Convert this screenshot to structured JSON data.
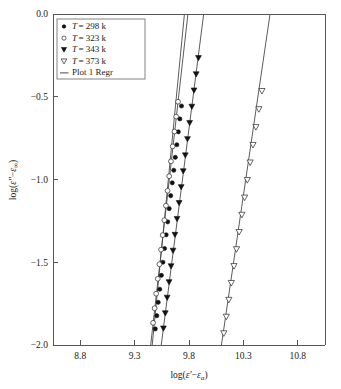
{
  "chart_data": {
    "type": "scatter",
    "title": "",
    "xlabel": "log(ε′−εₐ)",
    "ylabel": "log(ε″−ε∞)",
    "xlim": [
      8.55,
      11.05
    ],
    "ylim": [
      -2.0,
      0.0
    ],
    "xticks": [
      "8.8",
      "9.3",
      "9.8",
      "10.3",
      "10.8"
    ],
    "xtick_values": [
      8.8,
      9.3,
      9.8,
      10.3,
      10.8
    ],
    "yticks": [
      "0.0",
      "-0.5",
      "-1.0",
      "-1.5",
      "-2.0"
    ],
    "ytick_values": [
      0.0,
      -0.5,
      -1.0,
      -1.5,
      -2.0
    ],
    "grid": false,
    "legend_position": "top-left",
    "series": [
      {
        "name": "T = 298 k",
        "marker": "filled-circle",
        "points": [
          [
            9.49,
            -1.903
          ],
          [
            9.504,
            -1.823
          ],
          [
            9.517,
            -1.742
          ],
          [
            9.531,
            -1.663
          ],
          [
            9.546,
            -1.579
          ],
          [
            9.56,
            -1.5
          ],
          [
            9.575,
            -1.417
          ],
          [
            9.59,
            -1.334
          ],
          [
            9.604,
            -1.256
          ],
          [
            9.618,
            -1.176
          ],
          [
            9.632,
            -1.098
          ],
          [
            9.646,
            -1.02
          ],
          [
            9.66,
            -0.944
          ],
          [
            9.674,
            -0.866
          ],
          [
            9.688,
            -0.79
          ],
          [
            9.702,
            -0.712
          ],
          [
            9.716,
            -0.634
          ],
          [
            9.731,
            -0.556
          ]
        ]
      },
      {
        "name": "T = 323 k",
        "marker": "open-circle",
        "points": [
          [
            9.47,
            -1.866
          ],
          [
            9.484,
            -1.778
          ],
          [
            9.498,
            -1.69
          ],
          [
            9.513,
            -1.6
          ],
          [
            9.528,
            -1.512
          ],
          [
            9.543,
            -1.424
          ],
          [
            9.558,
            -1.336
          ],
          [
            9.573,
            -1.246
          ],
          [
            9.588,
            -1.158
          ],
          [
            9.603,
            -1.068
          ],
          [
            9.618,
            -0.98
          ],
          [
            9.634,
            -0.89
          ],
          [
            9.65,
            -0.8
          ],
          [
            9.666,
            -0.71
          ],
          [
            9.682,
            -0.62
          ],
          [
            9.699,
            -0.53
          ]
        ]
      },
      {
        "name": "T = 343 k",
        "marker": "filled-triangle-down",
        "points": [
          [
            9.565,
            -1.9
          ],
          [
            9.582,
            -1.808
          ],
          [
            9.599,
            -1.714
          ],
          [
            9.617,
            -1.62
          ],
          [
            9.635,
            -1.524
          ],
          [
            9.653,
            -1.43
          ],
          [
            9.671,
            -1.334
          ],
          [
            9.69,
            -1.238
          ],
          [
            9.709,
            -1.142
          ],
          [
            9.728,
            -1.046
          ],
          [
            9.747,
            -0.95
          ],
          [
            9.766,
            -0.854
          ],
          [
            9.786,
            -0.756
          ],
          [
            9.806,
            -0.658
          ],
          [
            9.826,
            -0.56
          ],
          [
            9.846,
            -0.462
          ],
          [
            9.866,
            -0.364
          ],
          [
            9.887,
            -0.266
          ]
        ]
      },
      {
        "name": "T = 373 k",
        "marker": "open-triangle-down",
        "points": [
          [
            10.12,
            -1.93
          ],
          [
            10.143,
            -1.83
          ],
          [
            10.166,
            -1.728
          ],
          [
            10.189,
            -1.626
          ],
          [
            10.213,
            -1.524
          ],
          [
            10.237,
            -1.422
          ],
          [
            10.261,
            -1.318
          ],
          [
            10.286,
            -1.214
          ],
          [
            10.311,
            -1.11
          ],
          [
            10.336,
            -1.004
          ],
          [
            10.362,
            -0.898
          ],
          [
            10.388,
            -0.792
          ],
          [
            10.415,
            -0.684
          ],
          [
            10.442,
            -0.576
          ],
          [
            10.47,
            -0.466
          ]
        ]
      }
    ],
    "regression_lines": [
      {
        "name": "Plot 1 Regr (298 k)",
        "x0": 9.462,
        "y0": -2.0,
        "x1": 9.758,
        "y1": 0.0
      },
      {
        "name": "Plot 1 Regr (323 k)",
        "x0": 9.448,
        "y0": -2.0,
        "x1": 9.79,
        "y1": 0.0
      },
      {
        "name": "Plot 1 Regr (343 k)",
        "x0": 9.545,
        "y0": -2.0,
        "x1": 9.935,
        "y1": 0.0
      },
      {
        "name": "Plot 1 Regr (373 k)",
        "x0": 10.098,
        "y0": -2.0,
        "x1": 10.545,
        "y1": 0.0
      }
    ],
    "legend": [
      {
        "marker": "filled-circle",
        "symbol": "T",
        "eq": "= 298 k",
        "label": "T = 298 k"
      },
      {
        "marker": "open-circle",
        "symbol": "T",
        "eq": "= 323 k",
        "label": "T = 323 k"
      },
      {
        "marker": "filled-triangle-down",
        "symbol": "T",
        "eq": "= 343 k",
        "label": "T = 343 k"
      },
      {
        "marker": "open-triangle-down",
        "symbol": "T",
        "eq": "= 373 k",
        "label": "T = 373 k"
      },
      {
        "marker": "line",
        "symbol": "",
        "eq": "Plot 1 Regr",
        "label": "Plot 1 Regr"
      }
    ]
  }
}
